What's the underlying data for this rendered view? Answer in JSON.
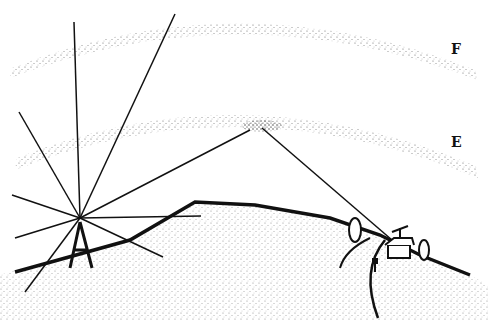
{
  "diagram": {
    "type": "illustration",
    "layers": [
      {
        "id": "F",
        "label": "F"
      },
      {
        "id": "E",
        "label": "E"
      }
    ],
    "elements": [
      "transmitter-tower",
      "radiating-rays",
      "hill",
      "reflection-point",
      "house-with-antenna",
      "trees",
      "mailbox",
      "road"
    ],
    "colors": {
      "ink": "#111111",
      "background": "#ffffff",
      "stipple": "#333333"
    }
  }
}
